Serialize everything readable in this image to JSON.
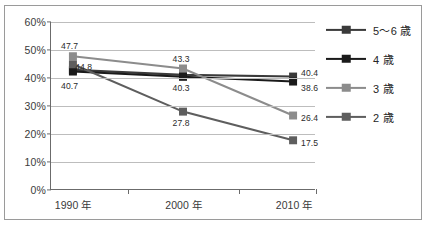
{
  "chart_data": {
    "type": "line",
    "title": "",
    "subtitle": "",
    "xlabel": "",
    "ylabel": "",
    "categories": [
      "1990 年",
      "2000 年",
      "2010 年"
    ],
    "ylim": [
      0,
      60
    ],
    "ytick_values": [
      0,
      10,
      20,
      30,
      40,
      50,
      60
    ],
    "ytick_labels": [
      "0%",
      "10%",
      "20%",
      "30%",
      "40%",
      "50%",
      "60%"
    ],
    "grid": "horizontal",
    "legend_position": "right",
    "series": [
      {
        "name": "5〜6 歳",
        "color": "#3a3a3a",
        "values": [
          42.8,
          41.0,
          40.4
        ],
        "point_labels": [
          "",
          "",
          "40.4"
        ]
      },
      {
        "name": "4 歳",
        "color": "#1a1a1a",
        "values": [
          42.2,
          40.3,
          38.6
        ],
        "point_labels": [
          "40.7",
          "40.3",
          "38.6"
        ]
      },
      {
        "name": "3 歳",
        "color": "#8c8c8c",
        "values": [
          47.7,
          43.3,
          26.4
        ],
        "point_labels": [
          "47.7",
          "43.3",
          "26.4"
        ]
      },
      {
        "name": "2 歳",
        "color": "#5e5e5e",
        "values": [
          44.8,
          27.8,
          17.5
        ],
        "point_labels": [
          "44.8",
          "27.8",
          "17.5"
        ]
      }
    ],
    "annotations": [
      {
        "text": "47.7",
        "x_category": "1990 年",
        "value": 47.7
      },
      {
        "text": "44.8",
        "x_category": "1990 年",
        "value": 44.8
      },
      {
        "text": "40.7",
        "x_category": "1990 年",
        "value": 40.7
      },
      {
        "text": "43.3",
        "x_category": "2000 年",
        "value": 43.3
      },
      {
        "text": "40.3",
        "x_category": "2000 年",
        "value": 40.3
      },
      {
        "text": "27.8",
        "x_category": "2000 年",
        "value": 27.8
      },
      {
        "text": "40.4",
        "x_category": "2010 年",
        "value": 40.4
      },
      {
        "text": "38.6",
        "x_category": "2010 年",
        "value": 38.6
      },
      {
        "text": "26.4",
        "x_category": "2010 年",
        "value": 26.4
      },
      {
        "text": "17.5",
        "x_category": "2010 年",
        "value": 17.5
      }
    ]
  },
  "legend": {
    "items": [
      {
        "label": "5〜6 歳",
        "color": "#3a3a3a"
      },
      {
        "label": "4 歳",
        "color": "#1a1a1a"
      },
      {
        "label": "3 歳",
        "color": "#8c8c8c"
      },
      {
        "label": "2 歳",
        "color": "#5e5e5e"
      }
    ]
  },
  "axis": {
    "y_labels": [
      "60%",
      "50%",
      "40%",
      "30%",
      "20%",
      "10%",
      "0%"
    ],
    "x_labels": [
      "1990 年",
      "2000 年",
      "2010 年"
    ]
  },
  "data_labels": {
    "y1990_top": "47.7",
    "y1990_mid": "44.8",
    "y1990_bottom": "40.7",
    "y2000_top": "43.3",
    "y2000_mid": "40.3",
    "y2000_low": "27.8",
    "y2010_top": "40.4",
    "y2010_second": "38.6",
    "y2010_third": "26.4",
    "y2010_bottom": "17.5"
  }
}
